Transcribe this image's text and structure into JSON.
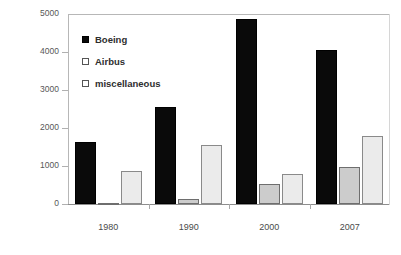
{
  "chart_data": {
    "type": "bar",
    "title": "",
    "subtitle": "",
    "xlabel": "",
    "ylabel": "US jet aircraft",
    "categories": [
      "1980",
      "1990",
      "2000",
      "2007"
    ],
    "series": [
      {
        "name": "Boeing",
        "values": [
          1630,
          2550,
          4880,
          4050
        ],
        "color": "#0a0a0a"
      },
      {
        "name": "Airbus",
        "values": [
          30,
          130,
          530,
          980
        ],
        "color": "#cccccc"
      },
      {
        "name": "miscellaneous",
        "values": [
          880,
          1560,
          780,
          1790
        ],
        "color": "#ebebeb"
      }
    ],
    "ylim": [
      0,
      5000
    ],
    "yticks": [
      0,
      1000,
      2000,
      3000,
      4000,
      5000
    ],
    "ytick_labels": [
      "0",
      "1000",
      "2000",
      "3000",
      "4000",
      "5000"
    ],
    "grid": false,
    "legend_position": "inside-top-left",
    "legend": [
      {
        "label": "Boeing",
        "marker": "filled-square"
      },
      {
        "label": "Airbus",
        "marker": "open-square"
      },
      {
        "label": "miscellaneous",
        "marker": "open-square"
      }
    ]
  }
}
